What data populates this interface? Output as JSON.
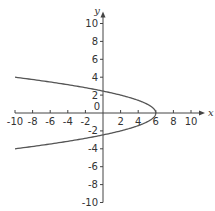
{
  "chart_data": {
    "type": "line",
    "title": "",
    "xlabel": "x",
    "ylabel": "y",
    "xlim": [
      -10,
      10
    ],
    "ylim": [
      -10,
      10
    ],
    "xticks": [
      -10,
      -8,
      -6,
      -4,
      -2,
      2,
      4,
      6,
      8,
      10
    ],
    "yticks": [
      10,
      8,
      6,
      4,
      2,
      -2,
      -4,
      -6,
      -8,
      -10
    ],
    "origin_label": "0",
    "grid": false,
    "series": [
      {
        "name": "x = 6 - y^2",
        "equation": "x = 6 - y^2",
        "color": "#555555",
        "y_range": [
          -4,
          4
        ]
      }
    ]
  }
}
